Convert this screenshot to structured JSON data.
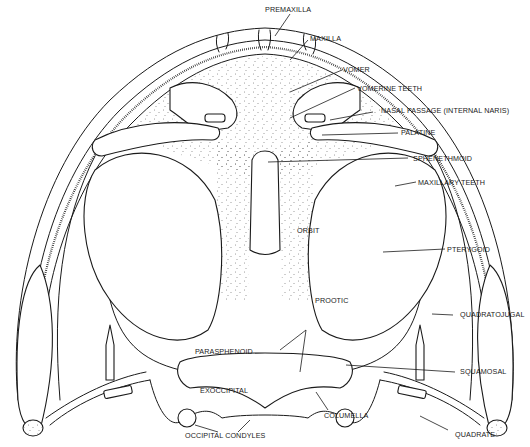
{
  "figure": {
    "colors": {
      "ink": "#1a1a1a",
      "background": "#ffffff"
    }
  },
  "labels": {
    "premaxilla": "PREMAXILLA",
    "maxilla": "MAXILLA",
    "vomer": "VOMER",
    "vomerine_teeth": "VOMERINE TEETH",
    "nasal_passage": "NASAL PASSAGE (INTERNAL NARIS)",
    "palatine": "PALATINE",
    "sphenethmoid": "SPHENETHMOID",
    "maxillary_teeth": "MAXILLARY TEETH",
    "orbit": "ORBIT",
    "pterygoid": "PTERYGOID",
    "prootic": "PROOTIC",
    "quadratojugal": "QUADRATOJUGAL",
    "parasphenoid": "PARASPHENOID",
    "squamosal": "SQUAMOSAL",
    "exoccipital": "EXOCCIPITAL",
    "columella": "COLUMELLA",
    "occipital_condyles": "OCCIPITAL CONDYLES",
    "quadrate": "QUADRATE"
  }
}
